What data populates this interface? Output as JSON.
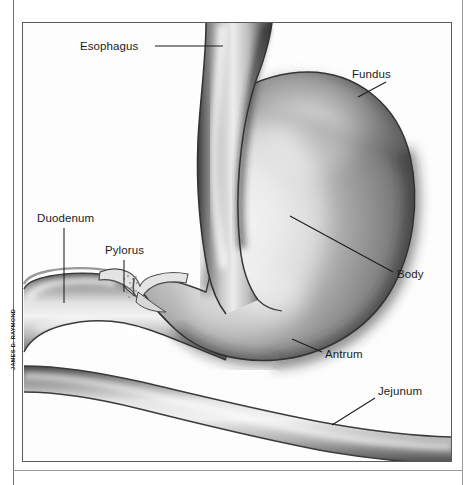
{
  "figure": {
    "credit": "JAMES D. RAYMOND",
    "style": "grayscale-airbrush-medical-illustration",
    "colors": {
      "page_background": "#ffffff",
      "frame_line": "#5a5a5a",
      "outer_rule": "#6e6e6e",
      "leader_line": "#1c1c1c",
      "label_text": "#1c1c1c",
      "organ_light": "#f2f2f2",
      "organ_mid": "#b4b4b4",
      "organ_dark": "#4a4a4a",
      "organ_shadow": "#2e2e2e"
    }
  },
  "labels": [
    {
      "id": "esophagus",
      "text": "Esophagus",
      "x": 80,
      "y": 40
    },
    {
      "id": "fundus",
      "text": "Fundus",
      "x": 352,
      "y": 68
    },
    {
      "id": "duodenum",
      "text": "Duodenum",
      "x": 37,
      "y": 212
    },
    {
      "id": "pylorus",
      "text": "Pylorus",
      "x": 105,
      "y": 244
    },
    {
      "id": "body",
      "text": "Body",
      "x": 397,
      "y": 268
    },
    {
      "id": "antrum",
      "text": "Antrum",
      "x": 325,
      "y": 348
    },
    {
      "id": "jejunum",
      "text": "Jejunum",
      "x": 378,
      "y": 385
    }
  ],
  "leader_lines": [
    {
      "id": "esophagus-leader",
      "x1": 155,
      "y1": 46,
      "x2": 223,
      "y2": 46
    },
    {
      "id": "fundus-leader",
      "x1": 386,
      "y1": 82,
      "x2": 358,
      "y2": 97
    },
    {
      "id": "duodenum-leader",
      "x1": 64,
      "y1": 228,
      "x2": 64,
      "y2": 303
    },
    {
      "id": "pylorus-leader",
      "x1": 124,
      "y1": 260,
      "x2": 124,
      "y2": 292
    },
    {
      "id": "body-leader",
      "x1": 290,
      "y1": 216,
      "x2": 393,
      "y2": 272
    },
    {
      "id": "antrum-leader",
      "x1": 292,
      "y1": 339,
      "x2": 322,
      "y2": 352
    },
    {
      "id": "jejunum-leader",
      "x1": 375,
      "y1": 398,
      "x2": 332,
      "y2": 425
    }
  ],
  "anatomy_parts": [
    "esophagus",
    "fundus",
    "body",
    "antrum",
    "pylorus",
    "duodenum",
    "jejunum"
  ]
}
